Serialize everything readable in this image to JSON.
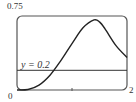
{
  "chart_data": {
    "type": "line",
    "title": "",
    "xlabel": "",
    "ylabel": "",
    "xlim": [
      0,
      2
    ],
    "ylim": [
      0,
      0.75
    ],
    "grid": false,
    "x_tick_labels": [
      "0",
      "2"
    ],
    "y_tick_labels": [
      "0.75"
    ],
    "annotations": [
      "y = 0.2"
    ],
    "series": [
      {
        "name": "curve",
        "x": [
          0,
          0.2,
          0.4,
          0.6,
          0.8,
          1.0,
          1.2,
          1.4,
          1.5,
          1.6,
          1.8,
          2.0
        ],
        "values": [
          0,
          0.005,
          0.05,
          0.15,
          0.3,
          0.47,
          0.63,
          0.71,
          0.69,
          0.62,
          0.45,
          0.33
        ]
      },
      {
        "name": "y = 0.2",
        "x": [
          0,
          2
        ],
        "values": [
          0.2,
          0.2
        ]
      }
    ]
  },
  "labels": {
    "ymax": "0.75",
    "origin": "0",
    "xmax": "2",
    "line": "y = 0.2"
  }
}
